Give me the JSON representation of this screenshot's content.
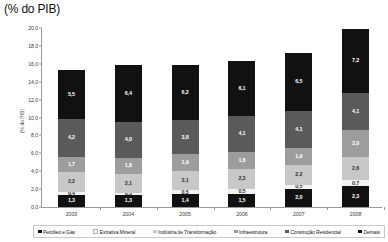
{
  "chart_data": {
    "type": "bar",
    "stacked": true,
    "title": "(% do PIB)",
    "xlabel": "",
    "ylabel": "(% do PIB)",
    "ylim": [
      0.0,
      20.0
    ],
    "ytick_step": 2.0,
    "grid": false,
    "legend_position": "bottom",
    "categories": [
      "2003",
      "2004",
      "2005",
      "2006",
      "2007",
      "2008"
    ],
    "ytick_labels": [
      "0,0",
      "2,0",
      "4,0",
      "6,0",
      "8,0",
      "10,0",
      "12,0",
      "14,0",
      "16,0",
      "18,0",
      "20,0"
    ],
    "series": [
      {
        "name": "Petróleo e Gás",
        "color": "#111111",
        "label_color": "#ffffff",
        "values": [
          1.3,
          1.3,
          1.4,
          1.5,
          2.0,
          2.3
        ],
        "value_labels": [
          "1,3",
          "1,3",
          "1,4",
          "1,5",
          "2,0",
          "2,3"
        ]
      },
      {
        "name": "Extrativa Mineral",
        "color": "#f2f2f2",
        "label_color": "#333333",
        "values": [
          0.4,
          0.3,
          0.5,
          0.5,
          0.5,
          0.7
        ],
        "value_labels": [
          "0,4",
          "0,3",
          "0,5",
          "0,5",
          "0,5",
          "0,7"
        ]
      },
      {
        "name": "Indústria de Transformação",
        "color": "#c8c8c8",
        "label_color": "#333333",
        "values": [
          2.2,
          2.1,
          2.1,
          2.3,
          2.2,
          2.6
        ],
        "value_labels": [
          "2,2",
          "2,1",
          "2,1",
          "2,3",
          "2,2",
          "2,6"
        ]
      },
      {
        "name": "Infraestrutura",
        "color": "#9d9d9d",
        "label_color": "#ffffff",
        "values": [
          1.7,
          1.8,
          1.9,
          1.8,
          1.9,
          3.0
        ],
        "value_labels": [
          "1,7",
          "1,8",
          "1,9",
          "1,8",
          "1,9",
          "3,0"
        ]
      },
      {
        "name": "Construção Residencial",
        "color": "#5a5a5a",
        "label_color": "#ffffff",
        "values": [
          4.2,
          4.0,
          3.8,
          4.1,
          4.1,
          4.1
        ],
        "value_labels": [
          "4,2",
          "4,0",
          "3,8",
          "4,1",
          "4,1",
          "4,1"
        ]
      },
      {
        "name": "Demais",
        "color": "#111111",
        "label_color": "#ffffff",
        "values": [
          5.5,
          6.4,
          6.2,
          6.1,
          6.5,
          7.2
        ],
        "value_labels": [
          "5,5",
          "6,4",
          "6,2",
          "6,1",
          "6,5",
          "7,2"
        ]
      }
    ],
    "totals": [
      15.3,
      15.9,
      15.9,
      16.3,
      17.2,
      19.9
    ]
  }
}
